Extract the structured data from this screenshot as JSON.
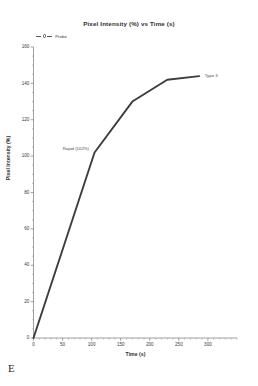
{
  "panel": {
    "label": "E"
  },
  "chart_data": {
    "type": "line",
    "title": "Pixel Intensity (%) vs Time (s)",
    "xlabel": "Time (s)",
    "ylabel": "Pixel Intensity (%)",
    "xlim": [
      0,
      350
    ],
    "ylim": [
      0,
      160
    ],
    "x_ticks": [
      0,
      50,
      100,
      150,
      200,
      250,
      300
    ],
    "x_tick_labels": [
      "0",
      "50",
      "100",
      "150",
      "200",
      "250",
      "300"
    ],
    "x_minor_step": 10,
    "y_ticks": [
      0,
      20,
      40,
      60,
      80,
      100,
      120,
      140,
      160
    ],
    "y_tick_labels": [
      "0",
      "20",
      "40",
      "60",
      "80",
      "100",
      "120",
      "140",
      "160"
    ],
    "y_minor_step": 5,
    "grid": false,
    "legend_position": "above-left",
    "line_color": "#3d3d3d",
    "series": [
      {
        "name": "Probe",
        "x": [
          0,
          105,
          170,
          230,
          285
        ],
        "values": [
          0,
          102,
          130,
          142,
          144
        ]
      }
    ],
    "annotations": [
      {
        "text": "Rapid (102%)",
        "x": 105,
        "y": 102
      },
      {
        "text": "Type 3",
        "x": 285,
        "y": 144
      }
    ]
  },
  "legend": {
    "entries": [
      {
        "label": "Probe",
        "marker": "circle-marker-icon"
      }
    ]
  }
}
